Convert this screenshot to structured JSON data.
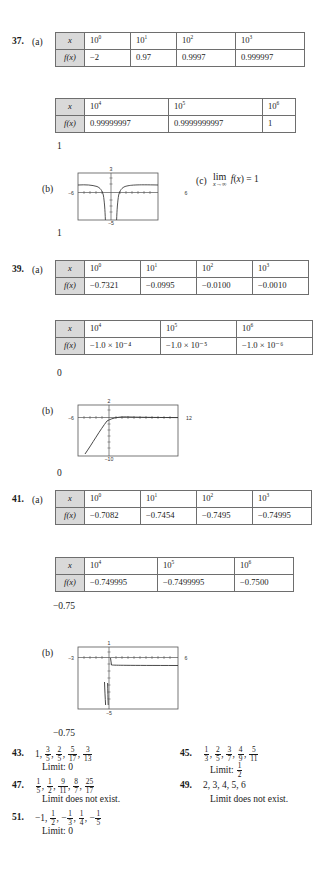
{
  "page": {
    "width": 323,
    "height": 892,
    "background": "#ffffff",
    "header_shade": "#d9d9d9"
  },
  "problems": [
    {
      "number": "37.",
      "part_a_label": "(a)",
      "part_b_label": "(b)",
      "part_c_label": "(c)",
      "tables": [
        {
          "row_labels": [
            "x",
            "f(x)"
          ],
          "x_values": [
            "10",
            "10",
            "10",
            "10"
          ],
          "x_exponents": [
            "0",
            "1",
            "2",
            "3"
          ],
          "f_values": [
            "−2",
            "0.97",
            "0.9997",
            "0.999997"
          ]
        },
        {
          "row_labels": [
            "x",
            "f(x)"
          ],
          "x_values": [
            "10",
            "10",
            "10"
          ],
          "x_exponents": [
            "4",
            "5",
            "6"
          ],
          "f_values": [
            "0.99999997",
            "0.9999999997",
            "1"
          ]
        }
      ],
      "stray_above": "1",
      "stray_below": "1",
      "graph": {
        "x_min_label": "−6",
        "x_max_label": "6",
        "y_max_label": "3",
        "y_min_label": "−5"
      },
      "limit_text": {
        "prefix": "lim",
        "sub": "x→∞",
        "body": "f(x) = 1"
      }
    },
    {
      "number": "39.",
      "part_a_label": "(a)",
      "part_b_label": "(b)",
      "tables": [
        {
          "row_labels": [
            "x",
            "f(x)"
          ],
          "x_values": [
            "10",
            "10",
            "10",
            "10"
          ],
          "x_exponents": [
            "0",
            "1",
            "2",
            "3"
          ],
          "f_values": [
            "−0.7321",
            "−0.0995",
            "−0.0100",
            "−0.0010"
          ]
        },
        {
          "row_labels": [
            "x",
            "f(x)"
          ],
          "x_values": [
            "10",
            "10",
            "10"
          ],
          "x_exponents": [
            "4",
            "5",
            "6"
          ],
          "f_values": [
            "−1.0 × 10⁻⁴",
            "−1.0 × 10⁻⁵",
            "−1.0 × 10⁻⁶"
          ]
        }
      ],
      "stray_above": "0",
      "stray_below": "0",
      "graph": {
        "x_min_label": "−6",
        "x_max_label": "12",
        "y_max_label": "2",
        "y_min_label": "−10"
      }
    },
    {
      "number": "41.",
      "part_a_label": "(a)",
      "part_b_label": "(b)",
      "tables": [
        {
          "row_labels": [
            "x",
            "f(x)"
          ],
          "x_values": [
            "10",
            "10",
            "10",
            "10"
          ],
          "x_exponents": [
            "0",
            "1",
            "2",
            "3"
          ],
          "f_values": [
            "−0.7082",
            "−0.7454",
            "−0.7495",
            "−0.74995"
          ]
        },
        {
          "row_labels": [
            "x",
            "f(x)"
          ],
          "x_values": [
            "10",
            "10",
            "10"
          ],
          "x_exponents": [
            "4",
            "5",
            "6"
          ],
          "f_values": [
            "−0.749995",
            "−0.7499995",
            "−0.7500"
          ]
        }
      ],
      "stray_above": "−0.75",
      "stray_below": "−0.75",
      "graph": {
        "x_min_label": "−3",
        "x_max_label": "6",
        "y_max_label": "1",
        "y_min_label": "−5"
      }
    }
  ],
  "answers": [
    {
      "number": "43.",
      "terms": [
        {
          "type": "int",
          "value": "1"
        },
        {
          "type": "frac",
          "num": "3",
          "den": "5"
        },
        {
          "type": "frac",
          "num": "2",
          "den": "5"
        },
        {
          "type": "frac",
          "num": "5",
          "den": "17"
        },
        {
          "type": "frac",
          "num": "3",
          "den": "13"
        }
      ],
      "limit_label": "Limit:",
      "limit_value": {
        "type": "int",
        "value": "0"
      }
    },
    {
      "number": "45.",
      "terms": [
        {
          "type": "frac",
          "num": "1",
          "den": "3"
        },
        {
          "type": "frac",
          "num": "2",
          "den": "5"
        },
        {
          "type": "frac",
          "num": "3",
          "den": "7"
        },
        {
          "type": "frac",
          "num": "4",
          "den": "9"
        },
        {
          "type": "frac",
          "num": "5",
          "den": "11"
        }
      ],
      "limit_label": "Limit:",
      "limit_value": {
        "type": "frac",
        "num": "1",
        "den": "2"
      }
    },
    {
      "number": "47.",
      "terms": [
        {
          "type": "frac",
          "num": "1",
          "den": "5"
        },
        {
          "type": "frac",
          "num": "1",
          "den": "2"
        },
        {
          "type": "frac",
          "num": "9",
          "den": "11"
        },
        {
          "type": "frac",
          "num": "8",
          "den": "7"
        },
        {
          "type": "frac",
          "num": "25",
          "den": "17"
        }
      ],
      "limit_label": "Limit does not exist.",
      "limit_value": null
    },
    {
      "number": "49.",
      "terms": [
        {
          "type": "int",
          "value": "2,"
        },
        {
          "type": "int",
          "value": "3,"
        },
        {
          "type": "int",
          "value": "4,"
        },
        {
          "type": "int",
          "value": "5,"
        },
        {
          "type": "int",
          "value": "6"
        }
      ],
      "limit_label": "Limit does not exist.",
      "limit_value": null
    },
    {
      "number": "51.",
      "terms": [
        {
          "type": "int",
          "value": "−1"
        },
        {
          "type": "frac",
          "num": "1",
          "den": "2"
        },
        {
          "type": "fracneg",
          "num": "1",
          "den": "3"
        },
        {
          "type": "frac",
          "num": "1",
          "den": "4"
        },
        {
          "type": "fracneg",
          "num": "1",
          "den": "5"
        }
      ],
      "limit_label": "Limit:",
      "limit_value": {
        "type": "int",
        "value": "0"
      }
    }
  ]
}
